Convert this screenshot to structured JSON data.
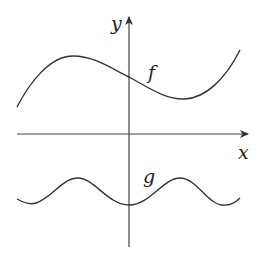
{
  "figure": {
    "axes": {
      "x_label": "x",
      "y_label": "y"
    },
    "curves": [
      {
        "name": "f",
        "label": "f",
        "description": "cubic-like curve: rises to a local max left of y-axis, falls through y-axis, local min right of y-axis, then rises"
      },
      {
        "name": "g",
        "label": "g",
        "description": "periodic wave below x-axis with a minimum at x=0 and peaks on either side"
      }
    ],
    "colors": {
      "stroke": "#333333",
      "background": "#ffffff"
    }
  }
}
